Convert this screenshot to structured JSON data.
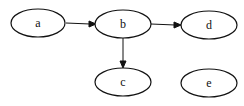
{
  "graph": {
    "type": "directed",
    "nodes": [
      {
        "id": "a",
        "label": "a",
        "cx": 38,
        "cy": 23
      },
      {
        "id": "b",
        "label": "b",
        "cx": 123,
        "cy": 24
      },
      {
        "id": "d",
        "label": "d",
        "cx": 208,
        "cy": 25
      },
      {
        "id": "c",
        "label": "c",
        "cx": 123,
        "cy": 82
      },
      {
        "id": "e",
        "label": "e",
        "cx": 208,
        "cy": 83
      }
    ],
    "edges": [
      {
        "from": "a",
        "to": "b"
      },
      {
        "from": "b",
        "to": "d"
      },
      {
        "from": "b",
        "to": "c"
      }
    ]
  }
}
